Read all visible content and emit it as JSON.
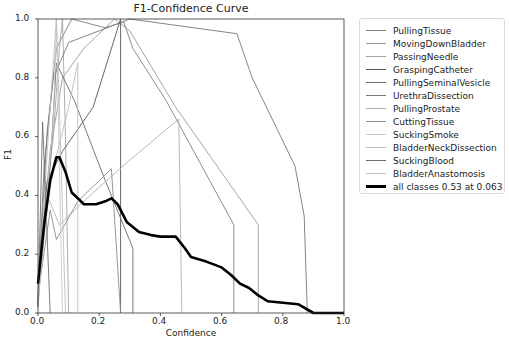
{
  "chart_data": {
    "type": "line",
    "title": "F1-Confidence Curve",
    "xlabel": "Confidence",
    "ylabel": "F1",
    "xlim": [
      0.0,
      1.0
    ],
    "ylim": [
      0.0,
      1.0
    ],
    "x_ticks": [
      "0.0",
      "0.2",
      "0.4",
      "0.6",
      "0.8",
      "1.0"
    ],
    "y_ticks": [
      "0.0",
      "0.2",
      "0.4",
      "0.6",
      "0.8",
      "1.0"
    ],
    "grid": false,
    "legend_position": "outside right, upper",
    "series": [
      {
        "name": "PullingTissue",
        "color": "#7f7f7f",
        "points": [
          [
            0,
            0.05
          ],
          [
            0.03,
            0.62
          ],
          [
            0.06,
            0.9
          ],
          [
            0.11,
            1.0
          ],
          [
            0.22,
            0.97
          ],
          [
            0.28,
            0.99
          ],
          [
            0.31,
            0.9
          ],
          [
            0.42,
            0.72
          ],
          [
            0.64,
            0.3
          ],
          [
            0.64,
            0.0
          ]
        ]
      },
      {
        "name": "MovingDownBladder",
        "color": "#9a9a9a",
        "points": [
          [
            0,
            0.1
          ],
          [
            0.04,
            0.55
          ],
          [
            0.08,
            0.8
          ],
          [
            0.15,
            0.9
          ],
          [
            0.25,
            1.0
          ],
          [
            0.3,
            0.96
          ],
          [
            0.45,
            0.7
          ],
          [
            0.72,
            0.3
          ],
          [
            0.72,
            0.0
          ]
        ]
      },
      {
        "name": "PassingNeedle",
        "color": "#a5a5a5",
        "points": [
          [
            0,
            0.02
          ],
          [
            0.02,
            0.35
          ],
          [
            0.05,
            0.6
          ],
          [
            0.07,
            0.9
          ],
          [
            0.08,
            1.0
          ],
          [
            0.09,
            0.6
          ],
          [
            0.1,
            0.0
          ]
        ]
      },
      {
        "name": "GraspingCatheter",
        "color": "#555555",
        "points": [
          [
            0,
            0.03
          ],
          [
            0.03,
            0.45
          ],
          [
            0.08,
            0.55
          ],
          [
            0.18,
            0.7
          ],
          [
            0.27,
            1.0
          ],
          [
            0.27,
            0.0
          ]
        ]
      },
      {
        "name": "PullingSeminalVesicle",
        "color": "#6a6a6a",
        "points": [
          [
            0,
            0.05
          ],
          [
            0.04,
            0.5
          ],
          [
            0.06,
            0.85
          ],
          [
            0.12,
            0.72
          ],
          [
            0.22,
            0.45
          ],
          [
            0.31,
            0.22
          ],
          [
            0.31,
            0.0
          ]
        ]
      },
      {
        "name": "UrethraDissection",
        "color": "#777777",
        "points": [
          [
            0,
            0.05
          ],
          [
            0.02,
            0.5
          ],
          [
            0.05,
            0.8
          ],
          [
            0.1,
            0.92
          ],
          [
            0.3,
            1.0
          ],
          [
            0.65,
            0.95
          ],
          [
            0.7,
            0.8
          ],
          [
            0.84,
            0.5
          ],
          [
            0.87,
            0.33
          ],
          [
            0.88,
            0.0
          ]
        ]
      },
      {
        "name": "PullingProstate",
        "color": "#b0b0b0",
        "points": [
          [
            0,
            0.04
          ],
          [
            0.03,
            0.4
          ],
          [
            0.07,
            0.3
          ],
          [
            0.17,
            0.4
          ],
          [
            0.3,
            0.52
          ],
          [
            0.46,
            0.66
          ],
          [
            0.47,
            0.0
          ]
        ]
      },
      {
        "name": "CuttingTissue",
        "color": "#8c8c8c",
        "points": [
          [
            0,
            0.06
          ],
          [
            0.04,
            0.35
          ],
          [
            0.06,
            0.25
          ],
          [
            0.13,
            0.38
          ],
          [
            0.24,
            0.49
          ],
          [
            0.27,
            0.0
          ]
        ]
      },
      {
        "name": "SuckingSmoke",
        "color": "#c8c8c8",
        "points": [
          [
            0,
            0.02
          ],
          [
            0.02,
            0.3
          ],
          [
            0.05,
            0.65
          ],
          [
            0.06,
            1.0
          ],
          [
            0.07,
            0.5
          ],
          [
            0.08,
            0.0
          ]
        ]
      },
      {
        "name": "BladderNeckDissection",
        "color": "#c0c0c0",
        "points": [
          [
            0,
            0.03
          ],
          [
            0.03,
            0.55
          ],
          [
            0.05,
            0.85
          ],
          [
            0.06,
            1.0
          ],
          [
            0.07,
            0.7
          ],
          [
            0.09,
            0.0
          ]
        ]
      },
      {
        "name": "SuckingBlood",
        "color": "#6e6e6e",
        "points": [
          [
            0,
            0.02
          ],
          [
            0.015,
            0.65
          ],
          [
            0.04,
            0.0
          ]
        ]
      },
      {
        "name": "BladderAnastomosis",
        "color": "#bdbdbd",
        "points": [
          [
            0,
            0.05
          ],
          [
            0.04,
            0.45
          ],
          [
            0.1,
            0.7
          ],
          [
            0.13,
            0.85
          ],
          [
            0.13,
            0.0
          ]
        ]
      }
    ],
    "aggregate": {
      "name": "all classes 0.53 at 0.063",
      "color": "#000000",
      "max_f1": 0.53,
      "at_confidence": 0.063,
      "points": [
        [
          0,
          0.1
        ],
        [
          0.02,
          0.3
        ],
        [
          0.04,
          0.45
        ],
        [
          0.06,
          0.53
        ],
        [
          0.07,
          0.53
        ],
        [
          0.09,
          0.48
        ],
        [
          0.11,
          0.41
        ],
        [
          0.13,
          0.39
        ],
        [
          0.15,
          0.37
        ],
        [
          0.19,
          0.37
        ],
        [
          0.22,
          0.38
        ],
        [
          0.24,
          0.39
        ],
        [
          0.26,
          0.37
        ],
        [
          0.29,
          0.31
        ],
        [
          0.33,
          0.275
        ],
        [
          0.37,
          0.265
        ],
        [
          0.4,
          0.26
        ],
        [
          0.45,
          0.26
        ],
        [
          0.48,
          0.22
        ],
        [
          0.5,
          0.19
        ],
        [
          0.55,
          0.175
        ],
        [
          0.6,
          0.155
        ],
        [
          0.63,
          0.13
        ],
        [
          0.66,
          0.1
        ],
        [
          0.69,
          0.085
        ],
        [
          0.72,
          0.06
        ],
        [
          0.75,
          0.04
        ],
        [
          0.8,
          0.035
        ],
        [
          0.85,
          0.03
        ],
        [
          0.9,
          0.0
        ],
        [
          1.0,
          0.0
        ]
      ]
    }
  }
}
